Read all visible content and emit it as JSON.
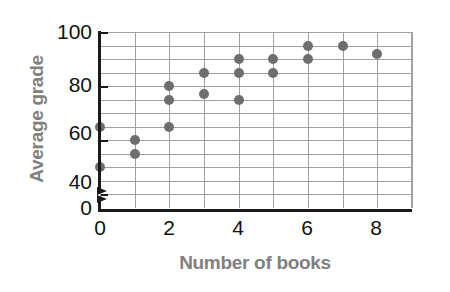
{
  "chart_data": {
    "type": "scatter",
    "title": "",
    "xlabel": "Number of books",
    "ylabel": "Average grade",
    "xlim": [
      0,
      9
    ],
    "ylim": [
      35,
      100
    ],
    "y_axis_break": true,
    "y_axis_break_note": "axis broken between 0 and 35",
    "grid": true,
    "legend": null,
    "xticks": [
      0,
      2,
      4,
      6,
      8
    ],
    "xtick_labels": [
      "0",
      "2",
      "4",
      "6",
      "8"
    ],
    "yticks": [
      0,
      40,
      60,
      80,
      100
    ],
    "ytick_labels": [
      "0",
      "40",
      "60",
      "80",
      "100"
    ],
    "x_gridline_values": [
      0,
      1,
      2,
      3,
      4,
      5,
      6,
      7,
      8,
      9
    ],
    "y_gridline_values": [
      40,
      45,
      50,
      55,
      60,
      65,
      70,
      75,
      80,
      85,
      90,
      95,
      100
    ],
    "point_color": "#6e6e6e",
    "grid_color": "#a0a0a0",
    "axis_color": "#1a1a1a",
    "label_color": "#808080",
    "points": [
      {
        "x": 0,
        "y": 65
      },
      {
        "x": 0,
        "y": 50
      },
      {
        "x": 1,
        "y": 60
      },
      {
        "x": 1,
        "y": 55
      },
      {
        "x": 2,
        "y": 80
      },
      {
        "x": 2,
        "y": 75
      },
      {
        "x": 2,
        "y": 65
      },
      {
        "x": 3,
        "y": 85
      },
      {
        "x": 3,
        "y": 77
      },
      {
        "x": 4,
        "y": 90
      },
      {
        "x": 4,
        "y": 85
      },
      {
        "x": 4,
        "y": 75
      },
      {
        "x": 5,
        "y": 90
      },
      {
        "x": 5,
        "y": 85
      },
      {
        "x": 6,
        "y": 95
      },
      {
        "x": 6,
        "y": 90
      },
      {
        "x": 7,
        "y": 95
      },
      {
        "x": 8,
        "y": 92
      }
    ]
  },
  "axis_titles": {
    "y": "Average grade",
    "x": "Number of books"
  },
  "y_tick_labels": {
    "t100": "100",
    "t80": "80",
    "t60": "60",
    "t40": "40",
    "t0": "0"
  },
  "x_tick_labels": {
    "t0": "0",
    "t2": "2",
    "t4": "4",
    "t6": "6",
    "t8": "8"
  }
}
